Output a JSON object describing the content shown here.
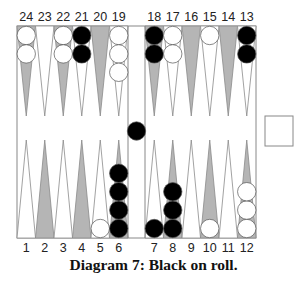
{
  "caption": "Diagram 7:  Black on roll.",
  "colors": {
    "dark_point": "#b5b5b5",
    "light_point": "#ffffff",
    "point_outline": "#8a8a8a",
    "black_checker": "#000000",
    "white_checker": "#ffffff",
    "board_outline": "#888888"
  },
  "labels": {
    "top": [
      "24",
      "23",
      "22",
      "21",
      "20",
      "19",
      "18",
      "17",
      "16",
      "15",
      "14",
      "13"
    ],
    "bottom": [
      "1",
      "2",
      "3",
      "4",
      "5",
      "6",
      "7",
      "8",
      "9",
      "10",
      "11",
      "12"
    ]
  },
  "position": {
    "points": {
      "24": {
        "color": "white",
        "count": 2
      },
      "23": {
        "color": null,
        "count": 0
      },
      "22": {
        "color": "white",
        "count": 2
      },
      "21": {
        "color": "black",
        "count": 2
      },
      "20": {
        "color": null,
        "count": 0
      },
      "19": {
        "color": "white",
        "count": 3
      },
      "18": {
        "color": "black",
        "count": 2
      },
      "17": {
        "color": "white",
        "count": 2
      },
      "16": {
        "color": null,
        "count": 0
      },
      "15": {
        "color": "white",
        "count": 1
      },
      "14": {
        "color": null,
        "count": 0
      },
      "13": {
        "color": "black",
        "count": 2
      },
      "1": {
        "color": null,
        "count": 0
      },
      "2": {
        "color": null,
        "count": 0
      },
      "3": {
        "color": null,
        "count": 0
      },
      "4": {
        "color": null,
        "count": 0
      },
      "5": {
        "color": "white",
        "count": 1
      },
      "6": {
        "color": "black",
        "count": 4
      },
      "7": {
        "color": "black",
        "count": 1
      },
      "8": {
        "color": "black",
        "count": 3
      },
      "9": {
        "color": null,
        "count": 0
      },
      "10": {
        "color": "white",
        "count": 1
      },
      "11": {
        "color": null,
        "count": 0
      },
      "12": {
        "color": "white",
        "count": 3
      }
    },
    "bar": {
      "black": 1,
      "white": 0
    },
    "cube": {
      "value": "",
      "position": "center"
    },
    "on_roll": "Black"
  }
}
